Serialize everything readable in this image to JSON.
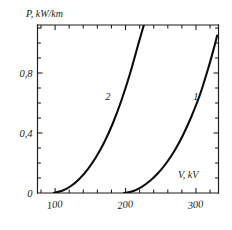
{
  "chart_data": {
    "type": "line",
    "title": "",
    "subtitle": "",
    "xlabel": "V, kV",
    "ylabel": "P, kW/km",
    "xlim": [
      75,
      332
    ],
    "ylim": [
      0,
      1.12
    ],
    "grid": false,
    "legend_position": "inline-curve-labels",
    "annotations": [
      "1",
      "2"
    ],
    "x_ticks_major": [
      100,
      200,
      300
    ],
    "x_tick_labels": [
      "100",
      "200",
      "300"
    ],
    "x_ticks_minor": [
      80,
      120,
      140,
      160,
      180,
      220,
      240,
      260,
      280,
      320
    ],
    "y_ticks_major": [
      0,
      0.4,
      0.8
    ],
    "y_tick_labels": [
      "0",
      "0,4",
      "0,8"
    ],
    "y_ticks_minor": [
      0.1,
      0.2,
      0.3,
      0.5,
      0.6,
      0.7,
      0.9,
      1.0,
      1.1
    ],
    "decimal_separator": ",",
    "series": [
      {
        "name": "1",
        "label": "1",
        "label_x": 300,
        "label_y": 0.62,
        "onset_x": 198,
        "points": [
          [
            198,
            0.0
          ],
          [
            210,
            0.012
          ],
          [
            222,
            0.038
          ],
          [
            234,
            0.078
          ],
          [
            246,
            0.132
          ],
          [
            258,
            0.2
          ],
          [
            270,
            0.285
          ],
          [
            282,
            0.39
          ],
          [
            294,
            0.515
          ],
          [
            306,
            0.66
          ],
          [
            318,
            0.84
          ],
          [
            326,
            0.975
          ],
          [
            330,
            1.05
          ]
        ]
      },
      {
        "name": "2",
        "label": "2",
        "label_x": 175,
        "label_y": 0.62,
        "onset_x": 98,
        "points": [
          [
            98,
            0.0
          ],
          [
            110,
            0.015
          ],
          [
            122,
            0.045
          ],
          [
            134,
            0.092
          ],
          [
            146,
            0.156
          ],
          [
            158,
            0.238
          ],
          [
            170,
            0.34
          ],
          [
            182,
            0.465
          ],
          [
            194,
            0.615
          ],
          [
            206,
            0.79
          ],
          [
            218,
            0.99
          ],
          [
            226,
            1.12
          ]
        ]
      }
    ]
  },
  "axes": {
    "y_axis_title": "P, kW/km",
    "x_axis_title": "V, kV"
  },
  "colors": {
    "curve": "#0d0d0d",
    "frame": "#1a1a1a",
    "background": "#ffffff"
  }
}
